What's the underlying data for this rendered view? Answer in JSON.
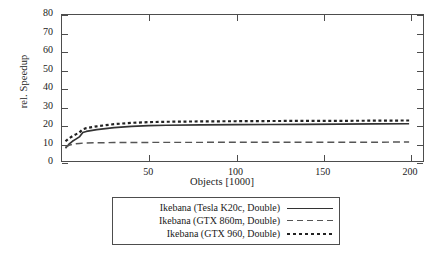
{
  "chart_data": {
    "type": "line",
    "title": "",
    "xlabel": "Objects [1000]",
    "ylabel": "rel. Speedup",
    "xlim": [
      0,
      208
    ],
    "ylim": [
      0,
      80
    ],
    "xticks": [
      50,
      100,
      150,
      200
    ],
    "yticks": [
      0,
      10,
      20,
      30,
      40,
      50,
      60,
      70,
      80
    ],
    "grid": false,
    "legend_position": "below-center",
    "series": [
      {
        "name": "Ikebana (Tesla K20c, Double)",
        "style": "solid",
        "color": "#333333",
        "x": [
          2,
          4,
          6,
          8,
          10,
          12,
          14,
          20,
          30,
          40,
          50,
          60,
          80,
          100,
          120,
          140,
          160,
          180,
          200
        ],
        "values": [
          7.0,
          9.2,
          10.8,
          12.0,
          13.2,
          15.6,
          16.2,
          17.2,
          18.3,
          19.0,
          19.4,
          19.6,
          19.8,
          19.9,
          20.0,
          20.1,
          20.2,
          20.3,
          20.4
        ]
      },
      {
        "name": "Ikebana (GTX 860m, Double)",
        "style": "dashed",
        "color": "#555555",
        "x": [
          2,
          4,
          6,
          8,
          10,
          12,
          14,
          20,
          30,
          40,
          50,
          60,
          80,
          100,
          120,
          140,
          160,
          180,
          200
        ],
        "values": [
          7.6,
          8.6,
          9.1,
          9.4,
          9.6,
          9.8,
          9.9,
          10.0,
          10.1,
          10.1,
          10.2,
          10.2,
          10.2,
          10.3,
          10.3,
          10.3,
          10.3,
          10.3,
          10.4
        ]
      },
      {
        "name": "Ikebana (GTX 960, Double)",
        "style": "dotted",
        "color": "#222222",
        "x": [
          2,
          4,
          6,
          8,
          10,
          12,
          14,
          20,
          30,
          40,
          50,
          60,
          80,
          100,
          120,
          140,
          160,
          180,
          200
        ],
        "values": [
          10.8,
          12.4,
          13.6,
          14.6,
          15.6,
          17.4,
          18.0,
          19.0,
          20.2,
          20.9,
          21.3,
          21.5,
          21.7,
          21.8,
          21.9,
          22.0,
          22.0,
          22.1,
          22.2
        ]
      }
    ]
  },
  "axes": {
    "ylabel": "rel. Speedup",
    "xlabel": "Objects [1000]",
    "ytick_labels": [
      "0",
      "10",
      "20",
      "30",
      "40",
      "50",
      "60",
      "70",
      "80"
    ],
    "xtick_labels": [
      "50",
      "100",
      "150",
      "200"
    ]
  },
  "legend": {
    "entries": [
      {
        "label": "Ikebana (Tesla K20c, Double)",
        "style": "solid"
      },
      {
        "label": "Ikebana (GTX 860m, Double)",
        "style": "dashed"
      },
      {
        "label": "Ikebana (GTX 960, Double)",
        "style": "dotted"
      }
    ]
  },
  "colors": {
    "axis": "#4d4d4d",
    "text": "#1a1a1a",
    "background": "#ffffff"
  }
}
